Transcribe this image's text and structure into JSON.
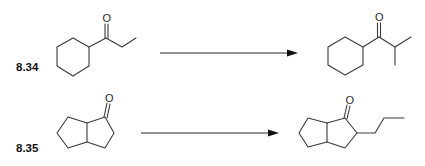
{
  "diagram": {
    "type": "reaction-scheme",
    "reactions": [
      {
        "number": "8.34",
        "reactant": {
          "name": "1-cyclohexylpropan-1-one",
          "atom_labels": [
            "O"
          ]
        },
        "arrow": "→",
        "product": {
          "name": "1-cyclohexyl-2-methylpropan-1-one",
          "atom_labels": [
            "O"
          ]
        }
      },
      {
        "number": "8.35",
        "reactant": {
          "name": "hexahydropentalen-1(2H)-one (bicyclic ketone)",
          "atom_labels": [
            "O"
          ]
        },
        "arrow": "→",
        "product": {
          "name": "2-propyl-hexahydropentalen-1(2H)-one",
          "atom_labels": [
            "O"
          ]
        }
      }
    ],
    "colors": {
      "bond": "#3a3a3a",
      "arrow": "#111111",
      "label": "#111111",
      "background": "#ffffff"
    }
  }
}
